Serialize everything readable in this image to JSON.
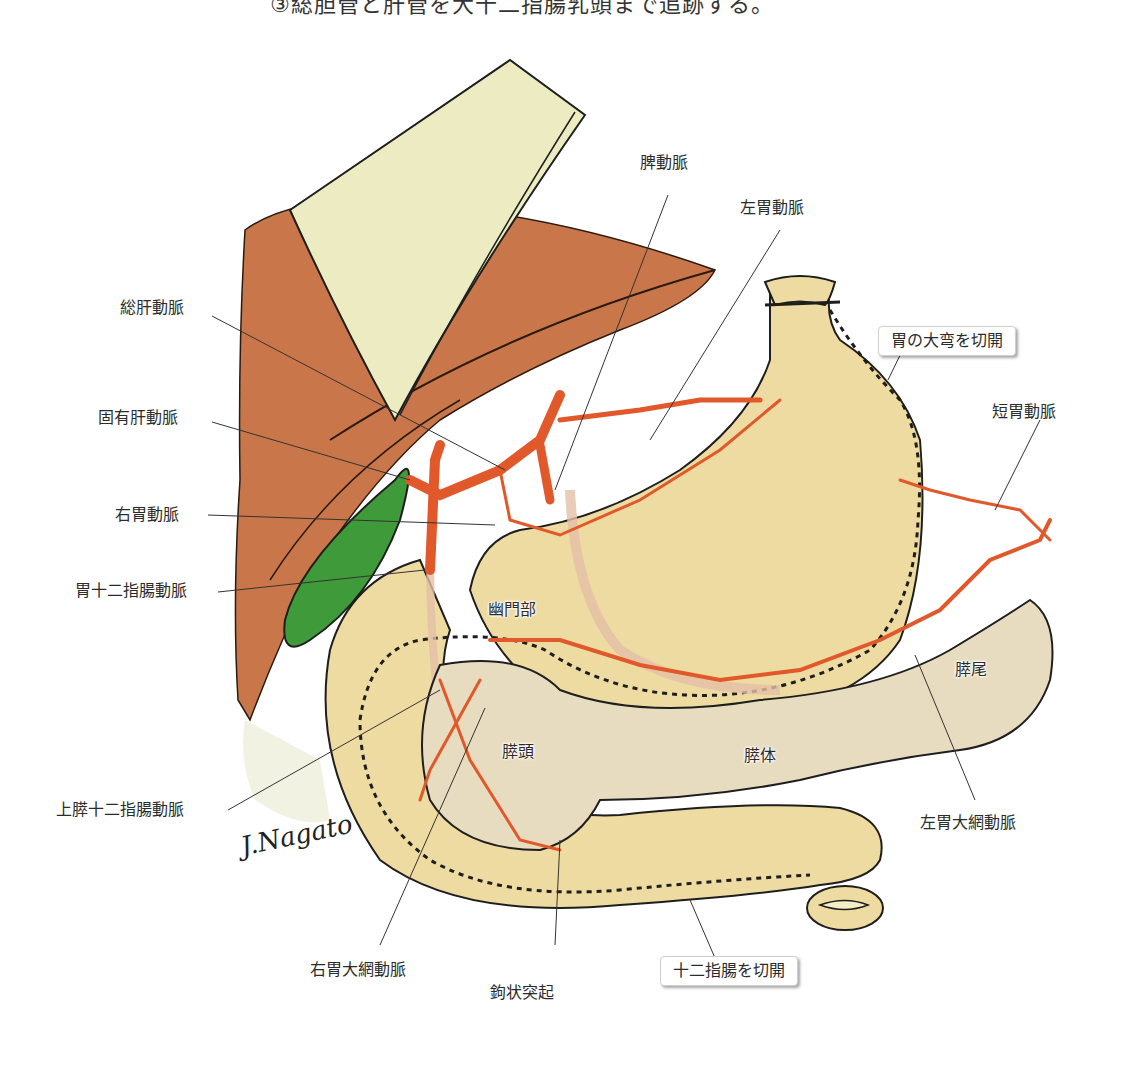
{
  "caption_top": "③総胆管と肝管を大十二指腸乳頭まで追跡する。",
  "colors": {
    "liver": "#c9774a",
    "omentum": "#ecebc1",
    "stomach": "#eedba1",
    "pancreas": "#e8dcc0",
    "artery": "#e1582a",
    "gallbladder": "#3f9a3a",
    "outline": "#1e1e1e"
  },
  "labels": {
    "splenic_artery": "脾動脈",
    "left_gastric_artery": "左胃動脈",
    "common_hepatic_artery": "総肝動脈",
    "proper_hepatic_artery": "固有肝動脈",
    "right_gastric_artery": "右胃動脈",
    "gastroduodenal_artery": "胃十二指腸動脈",
    "superior_pancreaticoduodenal_artery": "上膵十二指腸動脈",
    "right_gastroepiploic_artery": "右胃大網動脈",
    "uncinate_process": "鉤状突起",
    "short_gastric_artery": "短胃動脈",
    "left_gastroepiploic_artery": "左胃大網動脈"
  },
  "structures": {
    "pylorus": "幽門部",
    "pancreas_head": "膵頭",
    "pancreas_body": "膵体",
    "pancreas_tail": "膵尾"
  },
  "callouts": {
    "greater_curvature": "胃の大弯を切開",
    "duodenum": "十二指腸を切開"
  },
  "signature": "J.Nagato"
}
